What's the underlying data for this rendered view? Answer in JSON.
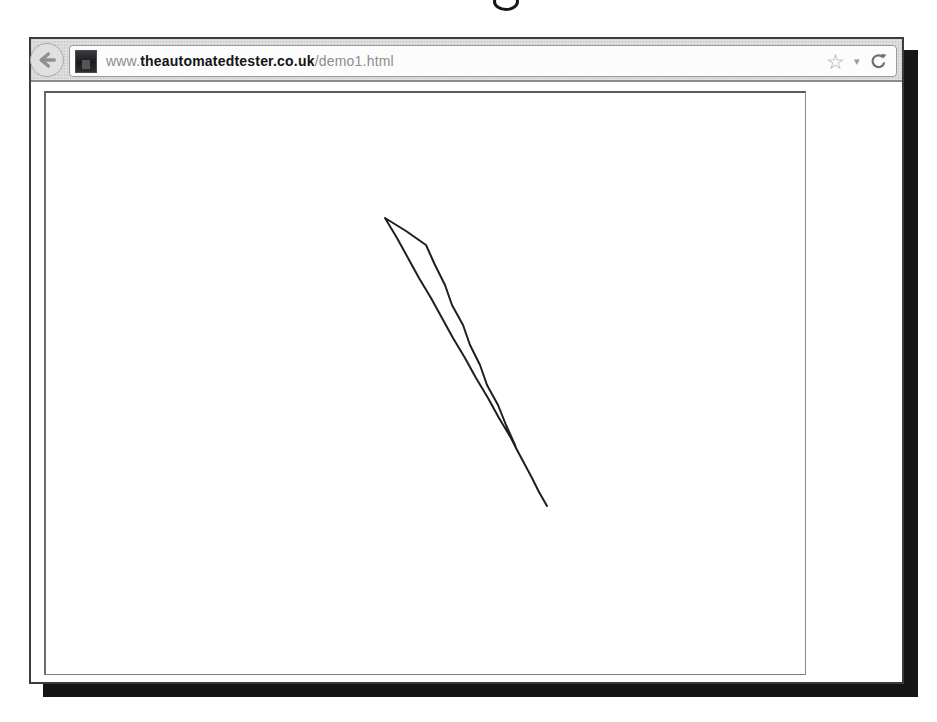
{
  "artifact": {
    "description": "bottom sliver of a letter from caption text cropped at top of screenshot"
  },
  "colors": {
    "window_border": "#3c3c3c",
    "window_shadow": "#161616",
    "toolbar_background": "#d9d9d9",
    "urlbar_background": "#fcfcfc",
    "frame_border": "#6b6b6b",
    "icon_gray": "#8f8f8f",
    "stroke_color": "#1f1f1f"
  },
  "browser": {
    "toolbar": {
      "back_button": {
        "icon": "left-arrow"
      },
      "url_bar": {
        "favicon": "site-logo-dark-square",
        "url_prefix": "www.",
        "url_domain": "theautomatedtester.co.uk",
        "url_path": "/demo1.html",
        "star_char": "☆",
        "dropdown_char": "▾",
        "reload_icon": "clockwise-arrow"
      }
    },
    "page": {
      "canvas_drawing": {
        "stroke_color": "#1f1f1f",
        "stroke_width": 2,
        "outline_points": [
          [
            339,
            125
          ],
          [
            360,
            138
          ],
          [
            380,
            152
          ],
          [
            389,
            172
          ],
          [
            399,
            192
          ],
          [
            406,
            212
          ],
          [
            417,
            232
          ],
          [
            424,
            252
          ],
          [
            434,
            272
          ],
          [
            441,
            292
          ],
          [
            452,
            312
          ],
          [
            460,
            332
          ],
          [
            469,
            352
          ],
          [
            470,
            355
          ],
          [
            465,
            345
          ],
          [
            453,
            325
          ],
          [
            442,
            305
          ],
          [
            430,
            285
          ],
          [
            419,
            265
          ],
          [
            407,
            245
          ],
          [
            396,
            225
          ],
          [
            385,
            205
          ],
          [
            373,
            185
          ],
          [
            362,
            165
          ],
          [
            351,
            145
          ],
          [
            339,
            125
          ]
        ],
        "tail_points": [
          [
            470,
            355
          ],
          [
            478,
            370
          ],
          [
            486,
            385
          ],
          [
            493,
            399
          ],
          [
            501,
            413
          ]
        ]
      }
    }
  }
}
